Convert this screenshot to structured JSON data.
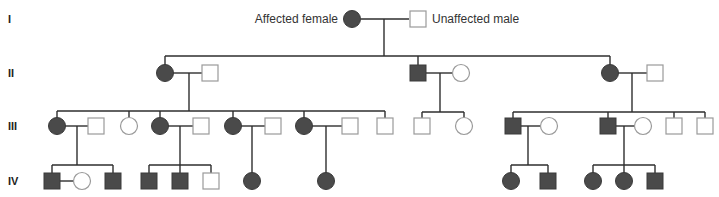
{
  "legend": {
    "affected_female": "Affected female",
    "unaffected_male": "Unaffected male"
  },
  "generations": [
    "I",
    "II",
    "III",
    "IV"
  ],
  "colors": {
    "affected_fill": "#4a4a4a",
    "unaffected_stroke": "#9a9a9a",
    "line": "#2e2e2e"
  },
  "individuals": [
    {
      "id": "I-1",
      "gen": "I",
      "sex": "female",
      "affected": true,
      "x": 352,
      "y": 19
    },
    {
      "id": "I-2",
      "gen": "I",
      "sex": "male",
      "affected": false,
      "x": 418,
      "y": 19
    },
    {
      "id": "II-1",
      "gen": "II",
      "sex": "female",
      "affected": true,
      "x": 165,
      "y": 73
    },
    {
      "id": "II-2",
      "gen": "II",
      "sex": "male",
      "affected": false,
      "x": 210,
      "y": 73
    },
    {
      "id": "II-3",
      "gen": "II",
      "sex": "male",
      "affected": true,
      "x": 418,
      "y": 73
    },
    {
      "id": "II-4",
      "gen": "II",
      "sex": "female",
      "affected": false,
      "x": 461,
      "y": 73
    },
    {
      "id": "II-5",
      "gen": "II",
      "sex": "female",
      "affected": true,
      "x": 610,
      "y": 73
    },
    {
      "id": "II-6",
      "gen": "II",
      "sex": "male",
      "affected": false,
      "x": 655,
      "y": 73
    },
    {
      "id": "III-1",
      "gen": "III",
      "sex": "female",
      "affected": true,
      "x": 57,
      "y": 126
    },
    {
      "id": "III-2",
      "gen": "III",
      "sex": "male",
      "affected": false,
      "x": 96,
      "y": 126
    },
    {
      "id": "III-3",
      "gen": "III",
      "sex": "female",
      "affected": false,
      "x": 129,
      "y": 126
    },
    {
      "id": "III-4",
      "gen": "III",
      "sex": "female",
      "affected": true,
      "x": 160,
      "y": 126
    },
    {
      "id": "III-5",
      "gen": "III",
      "sex": "male",
      "affected": false,
      "x": 201,
      "y": 126
    },
    {
      "id": "III-6",
      "gen": "III",
      "sex": "female",
      "affected": true,
      "x": 233,
      "y": 126
    },
    {
      "id": "III-7",
      "gen": "III",
      "sex": "male",
      "affected": false,
      "x": 273,
      "y": 126
    },
    {
      "id": "III-8",
      "gen": "III",
      "sex": "female",
      "affected": true,
      "x": 304,
      "y": 126
    },
    {
      "id": "III-9",
      "gen": "III",
      "sex": "male",
      "affected": false,
      "x": 350,
      "y": 126
    },
    {
      "id": "III-10",
      "gen": "III",
      "sex": "male",
      "affected": false,
      "x": 385,
      "y": 126
    },
    {
      "id": "III-11",
      "gen": "III",
      "sex": "male",
      "affected": false,
      "x": 422,
      "y": 126
    },
    {
      "id": "III-12",
      "gen": "III",
      "sex": "female",
      "affected": false,
      "x": 464,
      "y": 126
    },
    {
      "id": "III-13",
      "gen": "III",
      "sex": "male",
      "affected": true,
      "x": 513,
      "y": 126
    },
    {
      "id": "III-14",
      "gen": "III",
      "sex": "female",
      "affected": false,
      "x": 549,
      "y": 126
    },
    {
      "id": "III-15",
      "gen": "III",
      "sex": "male",
      "affected": true,
      "x": 608,
      "y": 126
    },
    {
      "id": "III-16",
      "gen": "III",
      "sex": "female",
      "affected": false,
      "x": 643,
      "y": 126
    },
    {
      "id": "III-17",
      "gen": "III",
      "sex": "male",
      "affected": false,
      "x": 674,
      "y": 126
    },
    {
      "id": "III-18",
      "gen": "III",
      "sex": "male",
      "affected": false,
      "x": 705,
      "y": 126
    },
    {
      "id": "IV-1",
      "gen": "IV",
      "sex": "male",
      "affected": true,
      "x": 52,
      "y": 181
    },
    {
      "id": "IV-2",
      "gen": "IV",
      "sex": "female",
      "affected": false,
      "x": 82,
      "y": 181
    },
    {
      "id": "IV-3",
      "gen": "IV",
      "sex": "male",
      "affected": true,
      "x": 113,
      "y": 181
    },
    {
      "id": "IV-4",
      "gen": "IV",
      "sex": "male",
      "affected": true,
      "x": 149,
      "y": 181
    },
    {
      "id": "IV-5",
      "gen": "IV",
      "sex": "male",
      "affected": true,
      "x": 180,
      "y": 181
    },
    {
      "id": "IV-6",
      "gen": "IV",
      "sex": "male",
      "affected": false,
      "x": 211,
      "y": 181
    },
    {
      "id": "IV-7",
      "gen": "IV",
      "sex": "female",
      "affected": true,
      "x": 252,
      "y": 181
    },
    {
      "id": "IV-8",
      "gen": "IV",
      "sex": "female",
      "affected": true,
      "x": 326,
      "y": 181
    },
    {
      "id": "IV-9",
      "gen": "IV",
      "sex": "female",
      "affected": true,
      "x": 511,
      "y": 181
    },
    {
      "id": "IV-10",
      "gen": "IV",
      "sex": "male",
      "affected": true,
      "x": 548,
      "y": 181
    },
    {
      "id": "IV-11",
      "gen": "IV",
      "sex": "female",
      "affected": true,
      "x": 593,
      "y": 181
    },
    {
      "id": "IV-12",
      "gen": "IV",
      "sex": "female",
      "affected": true,
      "x": 624,
      "y": 181
    },
    {
      "id": "IV-13",
      "gen": "IV",
      "sex": "male",
      "affected": true,
      "x": 655,
      "y": 181
    }
  ],
  "lines": [
    [
      361,
      19,
      409,
      19
    ],
    [
      384,
      19,
      384,
      56
    ],
    [
      165,
      56,
      610,
      56
    ],
    [
      165,
      56,
      165,
      65
    ],
    [
      418,
      56,
      418,
      65
    ],
    [
      610,
      56,
      610,
      65
    ],
    [
      173,
      73,
      202,
      73
    ],
    [
      189,
      73,
      189,
      111
    ],
    [
      426,
      73,
      453,
      73
    ],
    [
      440,
      73,
      440,
      112
    ],
    [
      618,
      73,
      647,
      73
    ],
    [
      632,
      73,
      632,
      112
    ],
    [
      57,
      111,
      385,
      111
    ],
    [
      57,
      111,
      57,
      118
    ],
    [
      129,
      111,
      129,
      118
    ],
    [
      160,
      111,
      160,
      118
    ],
    [
      233,
      111,
      233,
      118
    ],
    [
      304,
      111,
      304,
      118
    ],
    [
      385,
      111,
      385,
      118
    ],
    [
      422,
      112,
      464,
      112
    ],
    [
      422,
      112,
      422,
      118
    ],
    [
      464,
      112,
      464,
      118
    ],
    [
      513,
      112,
      705,
      112
    ],
    [
      513,
      112,
      513,
      118
    ],
    [
      608,
      112,
      608,
      118
    ],
    [
      674,
      112,
      674,
      118
    ],
    [
      705,
      112,
      705,
      118
    ],
    [
      65,
      126,
      88,
      126
    ],
    [
      77,
      126,
      77,
      165
    ],
    [
      168,
      126,
      193,
      126
    ],
    [
      180,
      126,
      180,
      165
    ],
    [
      241,
      126,
      265,
      126
    ],
    [
      252,
      126,
      252,
      173
    ],
    [
      312,
      126,
      342,
      126
    ],
    [
      326,
      126,
      326,
      173
    ],
    [
      521,
      126,
      541,
      126
    ],
    [
      528,
      126,
      528,
      165
    ],
    [
      616,
      126,
      635,
      126
    ],
    [
      624,
      126,
      624,
      165
    ],
    [
      52,
      165,
      113,
      165
    ],
    [
      52,
      165,
      52,
      173
    ],
    [
      113,
      165,
      113,
      173
    ],
    [
      60,
      181,
      74,
      181
    ],
    [
      149,
      165,
      211,
      165
    ],
    [
      149,
      165,
      149,
      173
    ],
    [
      180,
      165,
      180,
      173
    ],
    [
      211,
      165,
      211,
      173
    ],
    [
      511,
      165,
      548,
      165
    ],
    [
      511,
      165,
      511,
      173
    ],
    [
      548,
      165,
      548,
      173
    ],
    [
      593,
      165,
      655,
      165
    ],
    [
      593,
      165,
      593,
      173
    ],
    [
      624,
      165,
      624,
      173
    ],
    [
      655,
      165,
      655,
      173
    ]
  ]
}
